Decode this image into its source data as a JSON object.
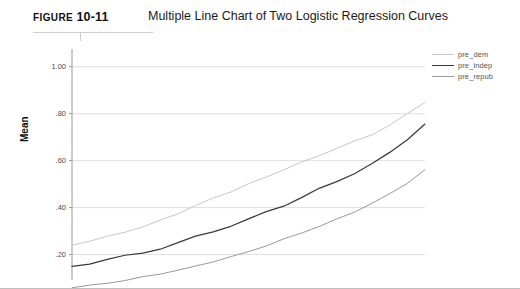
{
  "figure": {
    "label_word": "FIGURE",
    "number": "10-11",
    "title": "Multiple Line Chart of Two Logistic Regression Curves"
  },
  "chart_data": {
    "type": "line",
    "title": "Multiple Line Chart of Two Logistic Regression Curves",
    "xlabel": "",
    "ylabel": "Mean",
    "ylim": [
      0.1,
      1.05
    ],
    "yticks": [
      1.0,
      0.8,
      0.6,
      0.4,
      0.2
    ],
    "ytick_labels": [
      "1.00",
      ".80",
      ".60",
      ".40",
      ".20"
    ],
    "xlim": [
      0,
      100
    ],
    "xticks": [],
    "xtick_labels": [],
    "grid": "horizontal",
    "legend_position": "top-right",
    "x": [
      0,
      5,
      10,
      15,
      20,
      25,
      30,
      35,
      40,
      45,
      50,
      55,
      60,
      65,
      70,
      75,
      80,
      85,
      90,
      95,
      100
    ],
    "series": [
      {
        "name": "pre_dem",
        "color": "#c8c8c8",
        "values": [
          0.24,
          0.258,
          0.276,
          0.296,
          0.318,
          0.345,
          0.375,
          0.408,
          0.44,
          0.468,
          0.5,
          0.53,
          0.562,
          0.592,
          0.622,
          0.652,
          0.682,
          0.712,
          0.75,
          0.8,
          0.85
        ]
      },
      {
        "name": "pre_indep",
        "color": "#3a3a3a",
        "values": [
          0.15,
          0.163,
          0.178,
          0.193,
          0.208,
          0.226,
          0.248,
          0.276,
          0.3,
          0.322,
          0.348,
          0.382,
          0.41,
          0.442,
          0.478,
          0.512,
          0.548,
          0.585,
          0.632,
          0.692,
          0.758
        ]
      },
      {
        "name": "pre_repub",
        "color": "#9a9a9a",
        "values": [
          0.06,
          0.068,
          0.078,
          0.09,
          0.104,
          0.118,
          0.133,
          0.15,
          0.17,
          0.19,
          0.212,
          0.238,
          0.265,
          0.292,
          0.32,
          0.35,
          0.382,
          0.418,
          0.458,
          0.505,
          0.56
        ]
      }
    ]
  },
  "legend": {
    "items": [
      {
        "label": "pre_dem"
      },
      {
        "label": "pre_indep"
      },
      {
        "label": "pre_repub"
      }
    ]
  }
}
